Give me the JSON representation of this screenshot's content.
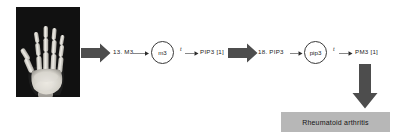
{
  "figure": {
    "xray": {
      "alt_name": "hand-radiograph",
      "background_color": "#0d0d0d",
      "bone_color": "#e8e6e0"
    },
    "arrows": {
      "block_color": "#4d4d4d",
      "right_1_name": "block-arrow-image-to-chain",
      "right_2_name": "block-arrow-chain-to-chain",
      "down_name": "block-arrow-to-diagnosis"
    },
    "flow": {
      "nodes": [
        {
          "id": "m3",
          "label": "m3"
        },
        {
          "id": "pip3",
          "label": "pip3"
        }
      ],
      "labels": {
        "feature_1": "13. M3",
        "output_1": "PIP3 [1]",
        "feature_2": "18. PIP3",
        "output_2": "PM3 [1]"
      },
      "edge_labels": {
        "edge_1": "t",
        "edge_2": "t"
      }
    },
    "diagnosis": {
      "label": "Rheumatoid arthritis",
      "box_color": "#b7b7b7"
    }
  }
}
